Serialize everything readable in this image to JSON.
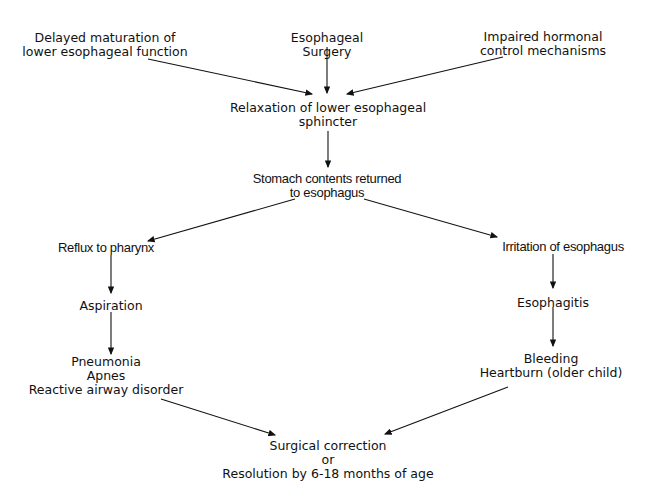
{
  "diagram": {
    "type": "flowchart",
    "nodes": {
      "delayed": [
        "Delayed maturation of",
        "lower esophageal function"
      ],
      "surgery": [
        "Esophageal",
        "Surgery"
      ],
      "hormonal": [
        "Impaired hormonal",
        "control mechanisms"
      ],
      "relaxation": [
        "Relaxation of lower esophageal",
        "sphincter"
      ],
      "stomach": [
        "Stomach contents returned",
        "to esophagus"
      ],
      "reflux": [
        "Reflux to pharynx"
      ],
      "irritation": [
        "Irritation of esophagus"
      ],
      "aspiration": [
        "Aspiration"
      ],
      "esophagitis": [
        "Esophagitis"
      ],
      "pneumonia": [
        "Pneumonia",
        "Apnes",
        "Reactive airway disorder"
      ],
      "bleeding": [
        "Bleeding",
        "Heartburn (older child)"
      ],
      "outcome": [
        "Surgical correction",
        "or",
        "Resolution by 6-18 months of age"
      ]
    },
    "edges": [
      [
        "delayed",
        "relaxation"
      ],
      [
        "surgery",
        "relaxation"
      ],
      [
        "hormonal",
        "relaxation"
      ],
      [
        "relaxation",
        "stomach"
      ],
      [
        "stomach",
        "reflux"
      ],
      [
        "stomach",
        "irritation"
      ],
      [
        "reflux",
        "aspiration"
      ],
      [
        "aspiration",
        "pneumonia"
      ],
      [
        "irritation",
        "esophagitis"
      ],
      [
        "esophagitis",
        "bleeding"
      ],
      [
        "pneumonia",
        "outcome"
      ],
      [
        "bleeding",
        "outcome"
      ]
    ]
  }
}
